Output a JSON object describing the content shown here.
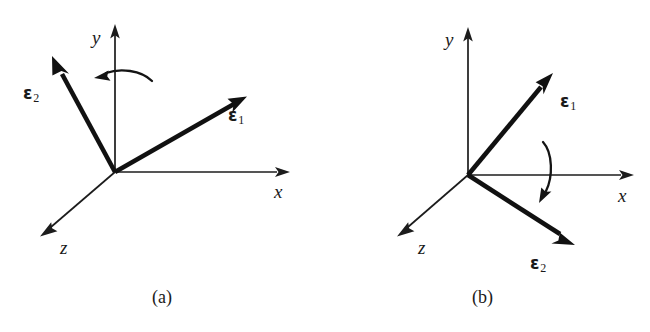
{
  "figure": {
    "background_color": "#ffffff",
    "ink_color": "#1a1a1a",
    "panels": [
      {
        "id": "a",
        "caption": "(a)",
        "origin": {
          "x": 115,
          "y": 172
        },
        "axes": [
          {
            "name": "x",
            "label": "x",
            "tip": {
              "x": 288,
              "y": 172
            },
            "label_pos": {
              "x": 274,
              "y": 182
            }
          },
          {
            "name": "y",
            "label": "y",
            "tip": {
              "x": 115,
              "y": 26
            },
            "label_pos": {
              "x": 92,
              "y": 28
            }
          },
          {
            "name": "z",
            "label": "z",
            "tip": {
              "x": 42,
              "y": 235
            },
            "label_pos": {
              "x": 60,
              "y": 238
            }
          }
        ],
        "vectors": [
          {
            "name": "epsilon-1",
            "label": "ε",
            "subscript": "1",
            "tip": {
              "x": 245,
              "y": 95
            },
            "label_pos": {
              "x": 228,
              "y": 107
            }
          },
          {
            "name": "epsilon-2",
            "label": "ε",
            "subscript": "2",
            "tip": {
              "x": 53,
              "y": 62
            },
            "label_pos": {
              "x": 23,
              "y": 85
            }
          }
        ],
        "rotation": {
          "name": "rotation-arrow-about-y",
          "direction": "counterclockwise-left",
          "axis": "y",
          "arrowhead_angle_deg": 200
        }
      },
      {
        "id": "b",
        "caption": "(b)",
        "origin": {
          "x": 468,
          "y": 175
        },
        "axes": [
          {
            "name": "x",
            "label": "x",
            "tip": {
              "x": 632,
              "y": 175
            },
            "label_pos": {
              "x": 618,
              "y": 186
            }
          },
          {
            "name": "y",
            "label": "y",
            "tip": {
              "x": 468,
              "y": 28
            },
            "label_pos": {
              "x": 445,
              "y": 30
            }
          },
          {
            "name": "z",
            "label": "z",
            "tip": {
              "x": 399,
              "y": 235
            },
            "label_pos": {
              "x": 418,
              "y": 238
            }
          }
        ],
        "vectors": [
          {
            "name": "epsilon-1",
            "label": "ε",
            "subscript": "1",
            "tip": {
              "x": 551,
              "y": 76
            },
            "label_pos": {
              "x": 560,
              "y": 93
            }
          },
          {
            "name": "epsilon-2",
            "label": "ε",
            "subscript": "2",
            "tip": {
              "x": 573,
              "y": 246
            },
            "label_pos": {
              "x": 530,
              "y": 255
            }
          }
        ],
        "rotation": {
          "name": "rotation-arrow-about-x",
          "direction": "downward",
          "axis": "x",
          "arrowhead_angle_deg": 110
        }
      }
    ]
  }
}
